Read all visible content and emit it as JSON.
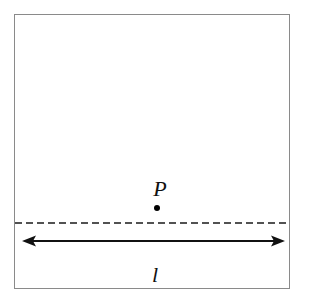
{
  "figure": {
    "type": "geometry-diagram",
    "background_color": "#ffffff",
    "frame": {
      "name": "outer-rectangle",
      "stroke_color": "#8a8a8a",
      "stroke_width": 1,
      "x": 14,
      "y": 14,
      "width": 276,
      "height": 275
    },
    "dashed_line": {
      "name": "dashed-guide-line",
      "stroke_color": "#1a1a1a",
      "stroke_width": 1.4,
      "dash_pattern": "7 4",
      "y": 223,
      "x_start": 15,
      "x_end": 289
    },
    "arrow": {
      "name": "double-headed-arrow",
      "stroke_color": "#111111",
      "stroke_width": 2,
      "y": 241,
      "x_start": 22,
      "x_end": 285,
      "head_length": 14,
      "head_width": 11
    },
    "point": {
      "name": "point-p",
      "label": "P",
      "label_x": 160,
      "label_y": 196,
      "dot_x": 157,
      "dot_y": 208,
      "dot_radius": 3,
      "dot_color": "#000000"
    },
    "line_label": {
      "name": "line-label-l",
      "label": "l",
      "x": 155,
      "y": 282
    }
  }
}
